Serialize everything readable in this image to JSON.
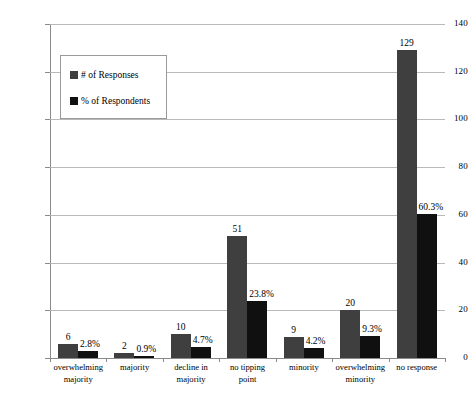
{
  "chart_data": {
    "type": "bar",
    "title": "",
    "subtitle": "",
    "xlabel": "",
    "ylabel": "",
    "ylim": [
      0,
      140
    ],
    "yticks": [
      0,
      20,
      40,
      60,
      80,
      100,
      120,
      140
    ],
    "ytick_labels": [
      "0",
      "20",
      "40",
      "60",
      "80",
      "100",
      "120",
      "140"
    ],
    "grid": true,
    "legend_position": "upper-left-inside",
    "categories": [
      "overwhelming majority",
      "majority",
      "decline in majority",
      "no tipping point",
      "minority",
      "overwhelming minority",
      "no response"
    ],
    "category_lines": [
      [
        "overwhelming",
        "majority"
      ],
      [
        "majority",
        ""
      ],
      [
        "decline in",
        "majority"
      ],
      [
        "no tipping",
        "point"
      ],
      [
        "minority",
        ""
      ],
      [
        "overwhelming",
        "minority"
      ],
      [
        "no response",
        ""
      ]
    ],
    "series": [
      {
        "name": "# of Responses",
        "color": "#3f3f3f",
        "values": [
          6,
          2,
          10,
          51,
          9,
          20,
          129
        ],
        "value_labels": [
          "6",
          "2",
          "10",
          "51",
          "9",
          "20",
          "129"
        ]
      },
      {
        "name": "% of Respondents",
        "color": "#101010",
        "values": [
          2.8,
          0.9,
          4.7,
          23.8,
          4.2,
          9.3,
          60.3
        ],
        "value_labels": [
          "2.8%",
          "0.9%",
          "4.7%",
          "23.8%",
          "4.2%",
          "9.3%",
          "60.3%"
        ]
      }
    ]
  },
  "legend": {
    "items": [
      {
        "label": "# of Responses",
        "color": "#3f3f3f"
      },
      {
        "label": "% of Respondents",
        "color": "#101010"
      }
    ]
  },
  "colors": {
    "series_responses": "#3f3f3f",
    "series_percent": "#101010",
    "gridline": "#b9b9b9",
    "axis": "#8a8a8a",
    "background": "#ffffff"
  }
}
